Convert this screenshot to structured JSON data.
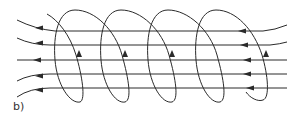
{
  "diagram": {
    "panel_label": "b)",
    "stroke_color": "#2a2a2a",
    "field_lines": [
      {
        "name": "field-line-1",
        "y": 31,
        "left_bend": -12,
        "right_bend": -8
      },
      {
        "name": "field-line-2",
        "y": 45,
        "left_bend": -8,
        "right_bend": -4
      },
      {
        "name": "field-line-3",
        "y": 60,
        "left_bend": 0,
        "right_bend": 0
      },
      {
        "name": "field-line-4",
        "y": 74,
        "left_bend": 8,
        "right_bend": 0
      },
      {
        "name": "field-line-5",
        "y": 88,
        "left_bend": 10,
        "right_bend": 0
      }
    ],
    "field_direction": "right-to-left",
    "coil_turns": 4,
    "current_direction": "upward on front side"
  }
}
